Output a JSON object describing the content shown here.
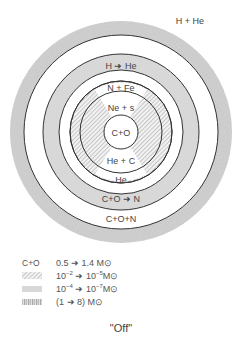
{
  "diagram": {
    "type": "concentric-shell-structure",
    "caption": "\"Off\"",
    "colors": {
      "speckled": "#c8c8c8",
      "grey_shell": "#d6d6d6",
      "hatch": "#a8a8a8",
      "line": "#333333",
      "background": "#ffffff"
    },
    "labels": {
      "envelope": "H + He",
      "h_burning": "H ➜ He",
      "n_fe": "N + Fe",
      "ne_s": "Ne + s",
      "core": "C+O",
      "he_c": "He + C",
      "he": "He",
      "cno_burning": "C+O ➜ N",
      "cno": "C+O+N"
    },
    "legend": [
      {
        "key": "C+O",
        "swatch": "text",
        "text": "0.5 ➜ 1.4 M⊙"
      },
      {
        "key": "",
        "swatch": "hatched",
        "base1": "10",
        "exp1": "−2",
        "arrow": " ➜ ",
        "base2": "10",
        "exp2": "−5",
        "unit": "M⊙"
      },
      {
        "key": "",
        "swatch": "grey",
        "base1": "10",
        "exp1": "−4",
        "arrow": " ➜ ",
        "base2": "10",
        "exp2": "−7",
        "unit": "M⊙"
      },
      {
        "key": "",
        "swatch": "speckled",
        "text": "(1 ➜ 8) M⊙"
      }
    ]
  }
}
